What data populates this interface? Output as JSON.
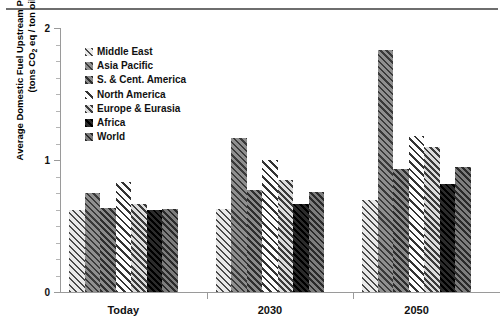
{
  "figure": {
    "ghost_header": "",
    "y_axis_title_line1": "Average Domestic Fuel Upstream Processing Intensity",
    "y_axis_title_line2_pre": "(tons CO",
    "y_axis_title_line2_sub": "2",
    "y_axis_title_line2_post": " eq / ton oil eq)"
  },
  "chart_data": {
    "type": "bar",
    "title": "",
    "xlabel": "",
    "ylabel": "Average Domestic Fuel Upstream Processing Intensity (tons CO2 eq / ton oil eq)",
    "ylim": [
      0,
      2
    ],
    "yticks": [
      0,
      1,
      2
    ],
    "ytick_labels": [
      "0",
      "1",
      "2"
    ],
    "yminor_ticks": [
      0.125,
      0.25,
      0.375,
      0.5,
      0.625,
      0.75,
      0.875,
      1.125,
      1.25,
      1.375,
      1.5,
      1.625,
      1.75,
      1.875
    ],
    "grid": false,
    "legend_position": "upper-left-inside",
    "categories": [
      "Today",
      "2030",
      "2050"
    ],
    "series": [
      {
        "name": "Middle East",
        "pattern": "diagonal-hatch-light-grey",
        "values": [
          0.62,
          0.63,
          0.7
        ]
      },
      {
        "name": "Asia Pacific",
        "pattern": "diagonal-hatch-mid-grey",
        "values": [
          0.75,
          1.17,
          1.83
        ]
      },
      {
        "name": "S. & Cent. America",
        "pattern": "diagonal-hatch-dark-grey",
        "values": [
          0.64,
          0.77,
          0.93
        ]
      },
      {
        "name": "North America",
        "pattern": "diagonal-hatch-white",
        "values": [
          0.83,
          1.0,
          1.18
        ]
      },
      {
        "name": "Europe & Eurasia",
        "pattern": "diagonal-hatch-pale-grey",
        "values": [
          0.67,
          0.85,
          1.1
        ]
      },
      {
        "name": "Africa",
        "pattern": "solid-black",
        "values": [
          0.62,
          0.67,
          0.82
        ]
      },
      {
        "name": "World",
        "pattern": "diagonal-hatch-grey",
        "values": [
          0.63,
          0.76,
          0.95
        ]
      }
    ]
  }
}
